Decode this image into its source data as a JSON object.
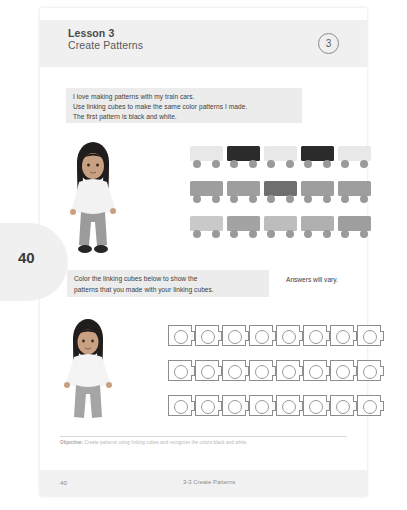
{
  "header": {
    "lesson_title": "Lesson 3",
    "lesson_subtitle": "Create Patterns",
    "badge_number": "3"
  },
  "page_tab": {
    "number": "40"
  },
  "instruction_1": {
    "line_1": "I love making patterns with my train cars.",
    "line_2": "Use linking cubes to make the same color patterns I made.",
    "line_3": "The first pattern is black and white."
  },
  "instruction_2": {
    "line_1": "Color the linking cubes below to show the",
    "line_2": "patterns that you made with your linking cubes.",
    "answers_note": "Answers will vary."
  },
  "colors": {
    "black": "#2b2b2b",
    "white": "#e8e8e8",
    "light_gray": "#d0d0d0",
    "mid_gray": "#a8a8a8",
    "dark_gray": "#6f6f6f",
    "band": "#f0f0f0",
    "cube_outline": "#8d8d8d"
  },
  "trains": [
    {
      "label": "train-row-1",
      "pattern_name": "black and white",
      "cars": [
        "#e8e8e8",
        "#2b2b2b",
        "#e8e8e8",
        "#2b2b2b",
        "#e8e8e8"
      ]
    },
    {
      "label": "train-row-2",
      "pattern_name": "gray with dark gray",
      "cars": [
        "#9e9e9e",
        "#9e9e9e",
        "#6f6f6f",
        "#9e9e9e",
        "#9e9e9e"
      ]
    },
    {
      "label": "train-row-3",
      "pattern_name": "light and medium gray",
      "cars": [
        "#c9c9c9",
        "#a3a3a3",
        "#bdbdbd",
        "#b0b0b0",
        "#9e9e9e"
      ]
    }
  ],
  "cube_rows": [
    {
      "label": "cube-row-1",
      "count": 8
    },
    {
      "label": "cube-row-2",
      "count": 8
    },
    {
      "label": "cube-row-3",
      "count": 8
    }
  ],
  "objective": {
    "prefix": "Objective:",
    "text": "Create patterns using linking cubes and recognize the colors black and white."
  },
  "footer": {
    "page_number": "40",
    "center_text": "3-3 Create Patterns"
  }
}
